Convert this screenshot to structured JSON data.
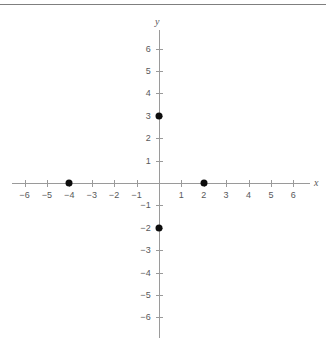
{
  "chart_data": {
    "type": "scatter",
    "title": "",
    "subtitle": "",
    "xlabel": "x",
    "ylabel": "y",
    "xlim": [
      -6.8,
      6.8
    ],
    "ylim": [
      -6.8,
      6.8
    ],
    "grid": false,
    "legend": null,
    "x_ticks": [
      -6,
      -5,
      -4,
      -3,
      -2,
      -1,
      1,
      2,
      3,
      4,
      5,
      6
    ],
    "y_ticks": [
      6,
      5,
      4,
      3,
      2,
      1,
      -1,
      -2,
      -3,
      -4,
      -5,
      -6
    ],
    "x_tick_labels": [
      "−6",
      "−5",
      "−4",
      "−3",
      "−2",
      "−1",
      "1",
      "2",
      "3",
      "4",
      "5",
      "6"
    ],
    "y_tick_labels": [
      "6",
      "5",
      "4",
      "3",
      "2",
      "1",
      "−1",
      "−2",
      "−3",
      "−4",
      "−5",
      "−6"
    ],
    "points": [
      {
        "x": 0,
        "y": 3,
        "label": "(0, 3)"
      },
      {
        "x": -4,
        "y": 0,
        "label": "(−4, 0)"
      },
      {
        "x": 2,
        "y": 0,
        "label": "(2, 0)"
      },
      {
        "x": 0,
        "y": -2,
        "label": "(0, −2)"
      }
    ],
    "marker": "filled-circle",
    "marker_color": "#0d0d0d",
    "axis_color": "#9a9a9a",
    "label_color": "#58585a",
    "background_color": "#ffffff"
  },
  "geometry": {
    "origin_x": 159,
    "origin_y": 183,
    "unit_px": 22.4,
    "x_axis_start": 12,
    "x_axis_end": 310,
    "y_axis_start": 30,
    "y_axis_end": 338,
    "x_axis_name_pos": {
      "left": 314,
      "top": 178
    },
    "y_axis_name_pos": {
      "left": 155,
      "top": 17
    }
  }
}
